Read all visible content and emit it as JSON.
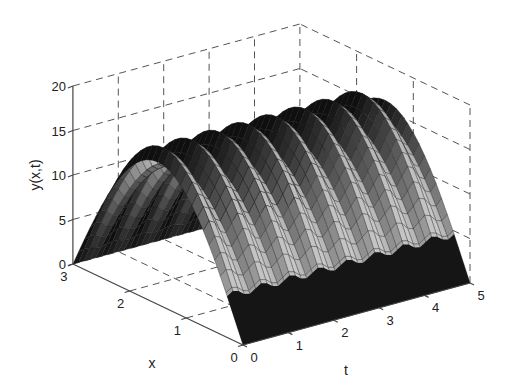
{
  "chart_data": {
    "type": "surface3d",
    "title": "",
    "xlabel": "x",
    "tlabel": "t",
    "zlabel": "y(x,t)",
    "x_range": [
      0,
      3
    ],
    "t_range": [
      0,
      5
    ],
    "z_range": [
      0,
      20
    ],
    "x_ticks": [
      "0",
      "1",
      "2",
      "3"
    ],
    "t_ticks": [
      "0",
      "1",
      "2",
      "3",
      "4",
      "5"
    ],
    "z_ticks": [
      "0",
      "5",
      "10",
      "15",
      "20"
    ],
    "grid": true,
    "surface": {
      "description": "arch in x (zero at x=0 and x=3, peak ~17 near x=1.5) with periodic ripples along t",
      "peak_value": 16,
      "ripple_amplitude": 1.5,
      "ripple_cycles_over_t": 8,
      "x_samples": 30,
      "t_samples": 40,
      "sample_values_at_t0": {
        "x": [
          0,
          0.5,
          1.0,
          1.5,
          2.0,
          2.5,
          3.0
        ],
        "y": [
          0,
          8,
          13.9,
          16,
          13.9,
          8,
          0
        ]
      }
    },
    "colors": {
      "surface_dark": "#151515",
      "surface_mid": "#6a6a6a",
      "surface_light": "#b0b0b0",
      "grid": "#555555",
      "background": "#ffffff"
    }
  }
}
